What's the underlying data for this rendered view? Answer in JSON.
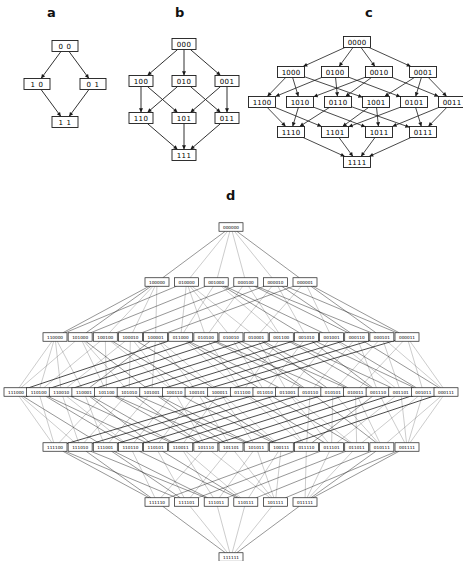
{
  "figure": {
    "background": "#ffffff",
    "ink": "#1a1a1a"
  },
  "panels": [
    {
      "id": "a",
      "label": "a",
      "dimension": 2,
      "levels": [
        [
          "0 0"
        ],
        [
          "1 0",
          "0 1"
        ],
        [
          "1 1"
        ]
      ]
    },
    {
      "id": "b",
      "label": "b",
      "dimension": 3,
      "levels": [
        [
          "000"
        ],
        [
          "100",
          "010",
          "001"
        ],
        [
          "110",
          "101",
          "011"
        ],
        [
          "111"
        ]
      ]
    },
    {
      "id": "c",
      "label": "c",
      "dimension": 4,
      "levels": [
        [
          "0000"
        ],
        [
          "1000",
          "0100",
          "0010",
          "0001"
        ],
        [
          "1100",
          "1010",
          "0110",
          "1001",
          "0101",
          "0011"
        ],
        [
          "1110",
          "1101",
          "1011",
          "0111"
        ],
        [
          "1111"
        ]
      ]
    },
    {
      "id": "d",
      "label": "d",
      "dimension": 6,
      "levels": [
        [
          "000000"
        ],
        [
          "100000",
          "010000",
          "001000",
          "000100",
          "000010",
          "000001"
        ],
        [
          "110000",
          "101000",
          "100100",
          "100010",
          "100001",
          "011000",
          "010100",
          "010010",
          "010001",
          "001100",
          "001010",
          "001001",
          "000110",
          "000101",
          "000011"
        ],
        [
          "111000",
          "110100",
          "110010",
          "110001",
          "101100",
          "101010",
          "101001",
          "100110",
          "100101",
          "100011",
          "011100",
          "011010",
          "011001",
          "010110",
          "010101",
          "010011",
          "001110",
          "001101",
          "001011",
          "000111"
        ],
        [
          "111100",
          "111010",
          "111001",
          "110110",
          "110101",
          "110011",
          "101110",
          "101101",
          "101011",
          "100111",
          "011110",
          "011101",
          "011011",
          "010111",
          "001111"
        ],
        [
          "111110",
          "111101",
          "111011",
          "110111",
          "101111",
          "011111"
        ],
        [
          "111111"
        ]
      ]
    }
  ]
}
